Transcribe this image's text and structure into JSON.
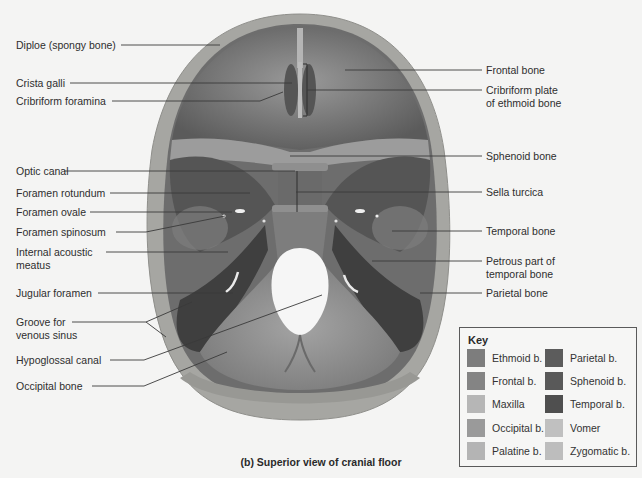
{
  "figure": {
    "caption": "(b) Superior view of cranial floor"
  },
  "labels_left": [
    {
      "id": "diploe",
      "text": "Diploe (spongy bone)",
      "x": 16,
      "y": 10
    },
    {
      "id": "crista-galli",
      "text": "Crista galli",
      "x": 16,
      "y": 76
    },
    {
      "id": "cribriform-foramina",
      "text": "Cribriform foramina",
      "x": 16,
      "y": 94
    },
    {
      "id": "optic-canal",
      "text": "Optic canal",
      "x": 16,
      "y": 164
    },
    {
      "id": "foramen-rotundum",
      "text": "Foramen rotundum",
      "x": 16,
      "y": 186
    },
    {
      "id": "foramen-ovale",
      "text": "Foramen ovale",
      "x": 16,
      "y": 205
    },
    {
      "id": "foramen-spinosum",
      "text": "Foramen spinosum",
      "x": 16,
      "y": 225
    },
    {
      "id": "internal-acoustic-meatus",
      "text": "Internal acoustic\nmeatus",
      "x": 16,
      "y": 245
    },
    {
      "id": "jugular-foramen",
      "text": "Jugular foramen",
      "x": 16,
      "y": 287
    },
    {
      "id": "groove-venous-sinus",
      "text": "Groove for\nvenous sinus",
      "x": 16,
      "y": 315
    },
    {
      "id": "hypoglossal-canal",
      "text": "Hypoglossal canal",
      "x": 16,
      "y": 353
    },
    {
      "id": "occipital-bone",
      "text": "Occipital bone",
      "x": 16,
      "y": 379
    }
  ],
  "labels_right": [
    {
      "id": "frontal-bone",
      "text": "Frontal bone",
      "x": 486,
      "y": 64
    },
    {
      "id": "cribriform-plate",
      "text": "Cribriform plate\nof ethmoid bone",
      "x": 486,
      "y": 84
    },
    {
      "id": "sphenoid-bone",
      "text": "Sphenoid bone",
      "x": 486,
      "y": 151
    },
    {
      "id": "sella-turcica",
      "text": "Sella turcica",
      "x": 486,
      "y": 186
    },
    {
      "id": "temporal-bone",
      "text": "Temporal bone",
      "x": 486,
      "y": 225
    },
    {
      "id": "petrous-part",
      "text": "Petrous part of\ntemporal bone",
      "x": 486,
      "y": 255
    },
    {
      "id": "parietal-bone",
      "text": "Parietal bone",
      "x": 486,
      "y": 287
    }
  ],
  "leader_lines": [
    {
      "x1": 121,
      "y1": 45,
      "x2": 220,
      "y2": 45
    },
    {
      "x1": 70,
      "y1": 83,
      "x2": 292,
      "y2": 83
    },
    {
      "x1": 112,
      "y1": 101,
      "x2": 260,
      "y2": 101,
      "x3": 283,
      "y3": 92
    },
    {
      "x1": 64,
      "y1": 171,
      "x2": 295,
      "y2": 171
    },
    {
      "x1": 110,
      "y1": 193,
      "x2": 250,
      "y2": 193
    },
    {
      "x1": 90,
      "y1": 212,
      "x2": 232,
      "y2": 212
    },
    {
      "x1": 116,
      "y1": 232,
      "x2": 146,
      "y2": 232,
      "x3": 225,
      "y3": 216
    },
    {
      "x1": 106,
      "y1": 252,
      "x2": 228,
      "y2": 252
    },
    {
      "x1": 98,
      "y1": 293,
      "x2": 233,
      "y2": 293
    },
    {
      "x1": 72,
      "y1": 322,
      "x2": 146,
      "y2": 322,
      "x3": 192,
      "y3": 302,
      "x4": 166,
      "y4": 337
    },
    {
      "x1": 110,
      "y1": 360,
      "x2": 144,
      "y2": 360,
      "x3": 322,
      "y3": 295
    },
    {
      "x1": 92,
      "y1": 386,
      "x2": 144,
      "y2": 386,
      "x3": 227,
      "y3": 352
    }
  ],
  "leader_lines_right": [
    {
      "x1": 345,
      "y1": 70,
      "x2": 482,
      "y2": 70
    },
    {
      "x1": 307,
      "y1": 90,
      "x2": 482,
      "y2": 90
    },
    {
      "x1": 290,
      "y1": 156,
      "x2": 482,
      "y2": 156
    },
    {
      "x1": 296,
      "y1": 192,
      "x2": 482,
      "y2": 192
    },
    {
      "x1": 392,
      "y1": 231,
      "x2": 482,
      "y2": 231
    },
    {
      "x1": 372,
      "y1": 261,
      "x2": 482,
      "y2": 261
    },
    {
      "x1": 420,
      "y1": 293,
      "x2": 482,
      "y2": 293
    }
  ],
  "key": {
    "title": "Key",
    "items": [
      {
        "label": "Ethmoid b.",
        "color": "#7d7d7d",
        "col": 0,
        "row": 0
      },
      {
        "label": "Frontal b.",
        "color": "#848484",
        "col": 0,
        "row": 1
      },
      {
        "label": "Maxilla",
        "color": "#b6b6b6",
        "col": 0,
        "row": 2
      },
      {
        "label": "Occipital b.",
        "color": "#9a9a9a",
        "col": 0,
        "row": 3
      },
      {
        "label": "Palatine b.",
        "color": "#b4b4b4",
        "col": 0,
        "row": 4
      },
      {
        "label": "Parietal b.",
        "color": "#5c5c5c",
        "col": 1,
        "row": 0
      },
      {
        "label": "Sphenoid b.",
        "color": "#595959",
        "col": 1,
        "row": 1
      },
      {
        "label": "Temporal b.",
        "color": "#4f4f4f",
        "col": 1,
        "row": 2
      },
      {
        "label": "Vomer",
        "color": "#c0c0c0",
        "col": 1,
        "row": 3
      },
      {
        "label": "Zygomatic b.",
        "color": "#bdbdbd",
        "col": 1,
        "row": 4
      }
    ]
  },
  "colors": {
    "background": "#f4f4f3",
    "bone_rim": "#a3a39f",
    "frontal_fossa": "#6f6f6f",
    "middle_fossa": "#5a5a5a",
    "posterior_fossa": "#8e8e8e",
    "dark_fossa": "#3f3f3f",
    "line": "#3a3a3a"
  }
}
